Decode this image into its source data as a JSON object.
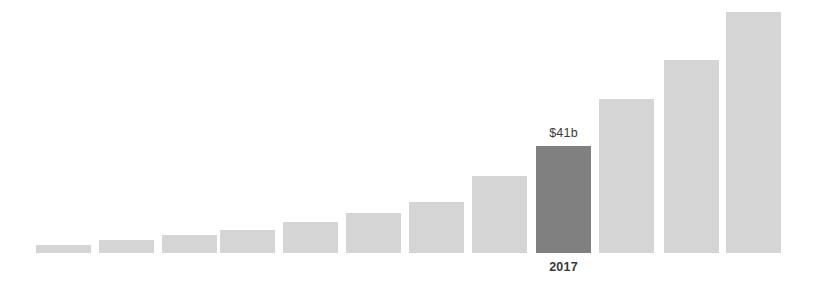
{
  "chart_data": {
    "type": "bar",
    "title": "",
    "subtitle": "",
    "xlabel": "",
    "ylabel": "",
    "grid": false,
    "legend": false,
    "ylim": [
      0,
      95
    ],
    "categories": [
      "",
      "",
      "",
      "",
      "",
      "",
      "",
      "",
      "2017",
      "",
      "",
      ""
    ],
    "values": [
      3,
      5,
      7,
      9,
      12,
      15,
      20,
      30,
      41,
      59,
      74,
      92
    ],
    "value_unit": "$b",
    "series": [
      {
        "name": "Amount",
        "values": [
          3,
          5,
          7,
          9,
          12,
          15,
          20,
          30,
          41,
          59,
          74,
          92
        ]
      }
    ],
    "annotations": [
      {
        "bar_index": 8,
        "value_label": "$41b",
        "category_label": "2017",
        "highlighted": true
      }
    ],
    "colors": {
      "bar": "#d5d5d5",
      "bar_highlight": "#808080",
      "label_text": "#3a3a3a",
      "background": "#ffffff"
    },
    "bars": [
      {
        "index": 0,
        "x": 36,
        "width": 55,
        "height": 8,
        "value": 3,
        "highlighted": false,
        "value_label": "",
        "category_label": ""
      },
      {
        "index": 1,
        "x": 99,
        "width": 55,
        "height": 13,
        "value": 5,
        "highlighted": false,
        "value_label": "",
        "category_label": ""
      },
      {
        "index": 2,
        "x": 162,
        "width": 55,
        "height": 18,
        "value": 7,
        "highlighted": false,
        "value_label": "",
        "category_label": ""
      },
      {
        "index": 3,
        "x": 220,
        "width": 55,
        "height": 23,
        "value": 9,
        "highlighted": false,
        "value_label": "",
        "category_label": ""
      },
      {
        "index": 4,
        "x": 283,
        "width": 55,
        "height": 31,
        "value": 12,
        "highlighted": false,
        "value_label": "",
        "category_label": ""
      },
      {
        "index": 5,
        "x": 346,
        "width": 55,
        "height": 40,
        "value": 15,
        "highlighted": false,
        "value_label": "",
        "category_label": ""
      },
      {
        "index": 6,
        "x": 409,
        "width": 55,
        "height": 51,
        "value": 20,
        "highlighted": false,
        "value_label": "",
        "category_label": ""
      },
      {
        "index": 7,
        "x": 472,
        "width": 55,
        "height": 77,
        "value": 30,
        "highlighted": false,
        "value_label": "",
        "category_label": ""
      },
      {
        "index": 8,
        "x": 536,
        "width": 55,
        "height": 107,
        "value": 41,
        "highlighted": true,
        "value_label": "$41b",
        "category_label": "2017"
      },
      {
        "index": 9,
        "x": 599,
        "width": 55,
        "height": 154,
        "value": 59,
        "highlighted": false,
        "value_label": "",
        "category_label": ""
      },
      {
        "index": 10,
        "x": 664,
        "width": 55,
        "height": 193,
        "value": 74,
        "highlighted": false,
        "value_label": "",
        "category_label": ""
      },
      {
        "index": 11,
        "x": 726,
        "width": 55,
        "height": 241,
        "value": 92,
        "highlighted": false,
        "value_label": "",
        "category_label": ""
      }
    ]
  }
}
